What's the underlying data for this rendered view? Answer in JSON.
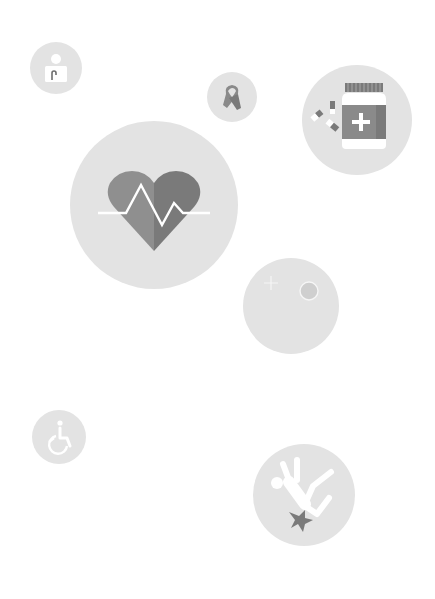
{
  "illustration": {
    "background": "#ffffff",
    "bubble_color": "#e3e3e3",
    "icons": [
      {
        "id": "person-badge",
        "label": "Person",
        "cx": 56,
        "cy": 68,
        "r": 26
      },
      {
        "id": "awareness-ribbon",
        "label": "Awareness ribbon",
        "cx": 232,
        "cy": 97,
        "r": 25
      },
      {
        "id": "medicine-bottle",
        "label": "Medicine bottle with pills",
        "cx": 357,
        "cy": 120,
        "r": 55
      },
      {
        "id": "heart-pulse",
        "label": "Heart with pulse line",
        "cx": 154,
        "cy": 205,
        "r": 84
      },
      {
        "id": "night-sparkle",
        "label": "Moon and sparkle",
        "cx": 291,
        "cy": 306,
        "r": 48
      },
      {
        "id": "wheelchair",
        "label": "Wheelchair accessibility",
        "cx": 59,
        "cy": 437,
        "r": 27
      },
      {
        "id": "falling-person",
        "label": "Falling person",
        "cx": 304,
        "cy": 495,
        "r": 51
      }
    ],
    "colors": {
      "icon_dark": "#7a7a7a",
      "icon_mid": "#8f8f8f",
      "icon_light": "#a8a8a8",
      "icon_white": "#ffffff"
    }
  }
}
